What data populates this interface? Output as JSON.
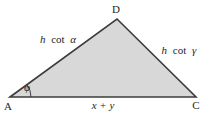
{
  "figure": {
    "vertices": {
      "top": "D",
      "bottom_left": "A",
      "bottom_right": "C"
    },
    "sides": {
      "left": {
        "var": "h",
        "fn": "cot",
        "angle": "α"
      },
      "right": {
        "var": "h",
        "fn": "cot",
        "angle": "γ"
      },
      "bottom": "x + y"
    },
    "angles": {
      "at_bottom_left": "φ"
    },
    "colors": {
      "triangle_fill": "#d8d8d8",
      "line": "#3d3d3d",
      "text": "#1f1f1f",
      "background": "#ffffff"
    }
  }
}
